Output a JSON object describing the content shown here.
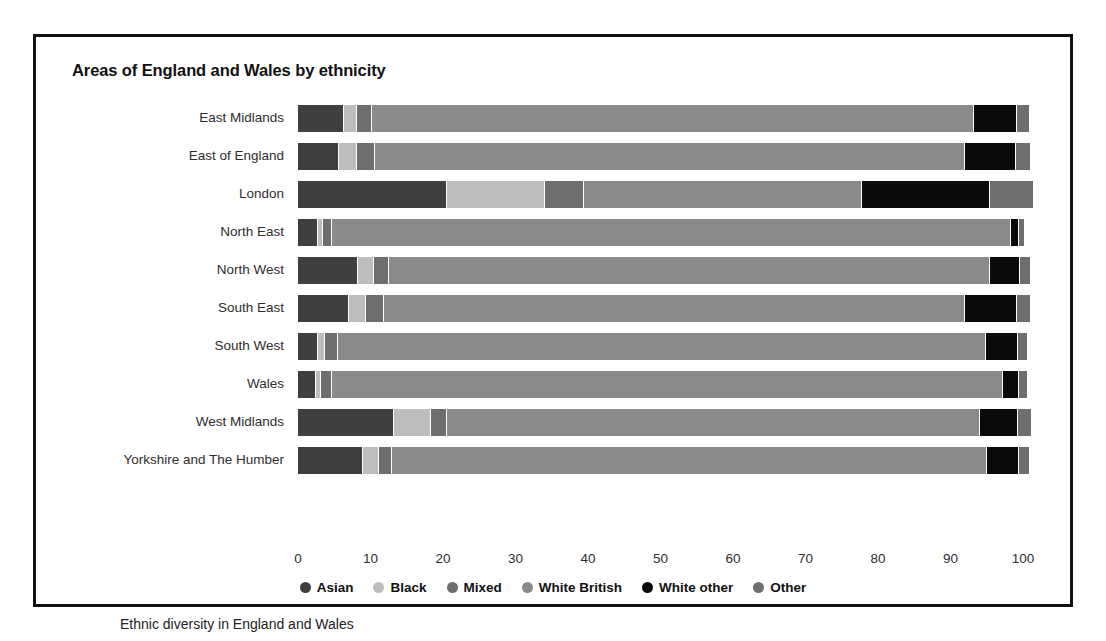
{
  "figure": {
    "title": "Areas of England and Wales by ethnicity",
    "caption": "Ethnic diversity in England and Wales"
  },
  "legend": {
    "position": "bottom-center",
    "items": [
      {
        "label": "Asian",
        "color": "#3f3f3f"
      },
      {
        "label": "Black",
        "color": "#bdbdbd"
      },
      {
        "label": "Mixed",
        "color": "#6e6e6e"
      },
      {
        "label": "White British",
        "color": "#8a8a8a"
      },
      {
        "label": "White other",
        "color": "#0a0a0a"
      },
      {
        "label": "Other",
        "color": "#6e6e6e"
      }
    ]
  },
  "axis": {
    "x_ticks": [
      "0",
      "10",
      "20",
      "30",
      "40",
      "50",
      "60",
      "70",
      "80",
      "90",
      "100"
    ],
    "x_min": 0,
    "x_max": 104
  },
  "chart_data": {
    "type": "bar",
    "orientation": "horizontal",
    "stacked": true,
    "title": "Areas of England and Wales by ethnicity",
    "xlabel": "",
    "ylabel": "",
    "xlim": [
      0,
      104
    ],
    "grid": false,
    "legend_position": "bottom-center",
    "categories": [
      "East Midlands",
      "East of England",
      "London",
      "North East",
      "North West",
      "South East",
      "South West",
      "Wales",
      "West Midlands",
      "Yorkshire and The Humber"
    ],
    "series": [
      {
        "name": "Asian",
        "color": "#3f3f3f",
        "values": [
          6.3,
          5.6,
          20.5,
          2.8,
          8.3,
          7.0,
          2.8,
          2.5,
          13.3,
          8.9
        ]
      },
      {
        "name": "Black",
        "color": "#bdbdbd",
        "values": [
          1.8,
          2.6,
          13.5,
          0.6,
          2.2,
          2.4,
          0.9,
          0.7,
          5.0,
          2.3
        ]
      },
      {
        "name": "Mixed",
        "color": "#6e6e6e",
        "values": [
          2.1,
          2.4,
          5.5,
          1.3,
          2.1,
          2.4,
          1.8,
          1.5,
          2.2,
          1.7
        ]
      },
      {
        "name": "White British",
        "color": "#8a8a8a",
        "values": [
          83.0,
          81.4,
          38.3,
          93.6,
          82.9,
          80.2,
          89.4,
          92.5,
          73.5,
          82.1
        ]
      },
      {
        "name": "White other",
        "color": "#0a0a0a",
        "values": [
          6.0,
          7.1,
          17.7,
          1.1,
          4.1,
          7.2,
          4.4,
          2.3,
          5.3,
          4.4
        ]
      },
      {
        "name": "Other",
        "color": "#6e6e6e",
        "values": [
          1.8,
          2.0,
          6.0,
          0.9,
          1.5,
          1.9,
          1.4,
          1.2,
          2.0,
          1.5
        ]
      }
    ]
  }
}
